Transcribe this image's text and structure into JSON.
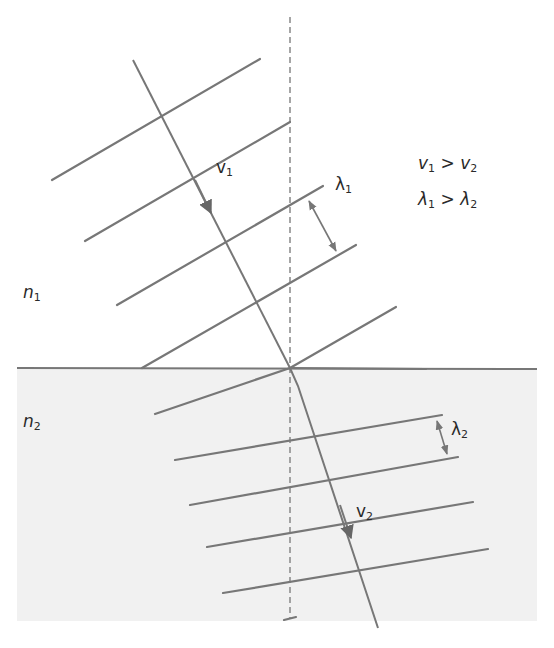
{
  "figure": {
    "colors": {
      "background": "#ffffff",
      "medium2_fill": "#f1f1f1",
      "line": "#777777",
      "text": "#2a2a2a"
    },
    "media": [
      {
        "name": "n",
        "sub": "1",
        "position": "upper"
      },
      {
        "name": "n",
        "sub": "2",
        "position": "lower"
      }
    ],
    "rays": [
      {
        "name": "v",
        "sub": "1",
        "medium": "n1"
      },
      {
        "name": "v",
        "sub": "2",
        "medium": "n2"
      }
    ],
    "wavelengths": [
      {
        "name": "λ",
        "sub": "1",
        "medium": "n1"
      },
      {
        "name": "λ",
        "sub": "2",
        "medium": "n2"
      }
    ],
    "relations": [
      {
        "left": "v",
        "left_sub": "1",
        "op": ">",
        "right": "v",
        "right_sub": "2"
      },
      {
        "left": "λ",
        "left_sub": "1",
        "op": ">",
        "right": "λ",
        "right_sub": "2"
      }
    ],
    "normal_line": "dashed"
  }
}
